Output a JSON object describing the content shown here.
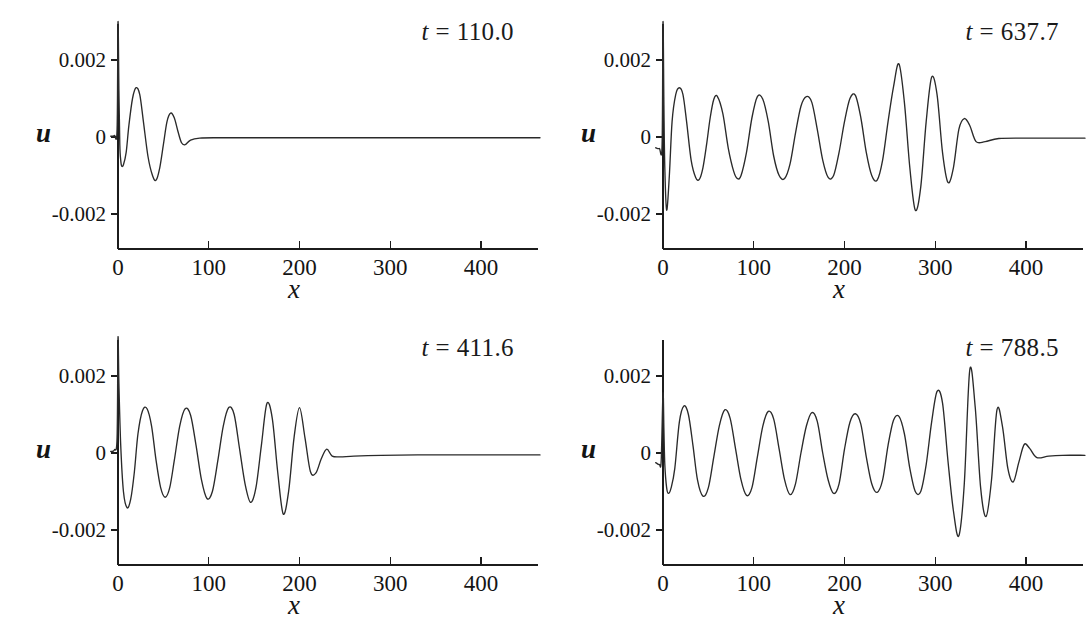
{
  "figure": {
    "background_color": "#ffffff",
    "line_color": "#2a2a2a",
    "axis_color": "#1c1c1c",
    "panel_count": 4,
    "layout": "2x2 grid"
  },
  "axes": {
    "xlabel": "x",
    "ylabel": "u",
    "x_ticks": [
      "0",
      "100",
      "200",
      "300",
      "400"
    ],
    "x_tick_values": [
      0,
      100,
      200,
      300,
      400
    ],
    "y_ticks": [
      "0.002",
      "0",
      "-0.002"
    ],
    "y_tick_values": [
      0.002,
      0,
      -0.002
    ],
    "xlim": [
      -8,
      465
    ],
    "ylim": [
      -0.0032,
      0.0032
    ],
    "grid": false
  },
  "panels": [
    {
      "id": "panel-t-110",
      "time_prefix": "t",
      "time_eq": "=",
      "time_value": "110.0",
      "label": "t = 110.0",
      "front_x": 70
    },
    {
      "id": "panel-t-637",
      "time_prefix": "t",
      "time_eq": "=",
      "time_value": "637.7",
      "label": "t = 637.7",
      "front_x": 325
    },
    {
      "id": "panel-t-411",
      "time_prefix": "t",
      "time_eq": "=",
      "time_value": "411.6",
      "label": "t = 411.6",
      "front_x": 215
    },
    {
      "id": "panel-t-788",
      "time_prefix": "t",
      "time_eq": "=",
      "time_value": "788.5",
      "label": "t = 788.5",
      "front_x": 390
    }
  ],
  "chart_data": [
    {
      "type": "line",
      "title": "t = 110.0",
      "xlabel": "x",
      "ylabel": "u",
      "xlim": [
        -8,
        465
      ],
      "ylim": [
        -0.0032,
        0.0032
      ],
      "xticks": [
        0,
        100,
        200,
        300,
        400
      ],
      "yticks": [
        -0.002,
        0,
        0.002
      ],
      "grid": false,
      "legend": "none",
      "description": "Dispersive wave train: narrow spike at x=0 clipped by upper axis limit, followed by a few decaying oscillations ending near x=70, then flat zero out to x=465.",
      "front_x": 70,
      "wavelength": 42,
      "max_amplitude": 0.0013,
      "series": [
        {
          "name": "u(x, t=110.0)",
          "points_x": [
            -8,
            -4,
            -1,
            0,
            1,
            2,
            3,
            4,
            6,
            9,
            12,
            16,
            20,
            24,
            28,
            33,
            38,
            42,
            46,
            50,
            54,
            58,
            62,
            66,
            70,
            74,
            80,
            90,
            110,
            150,
            200,
            260,
            320,
            380,
            430,
            465
          ],
          "points_y": [
            2e-05,
            4e-05,
            0.0002,
            0.0032,
            0.0012,
            -0.0002,
            -0.0006,
            -0.00075,
            -0.00072,
            -0.0004,
            0.0003,
            0.001,
            0.00128,
            0.0011,
            0.0004,
            -0.0005,
            -0.001,
            -0.00112,
            -0.0008,
            -0.0002,
            0.0004,
            0.00062,
            0.0005,
            0.00015,
            -0.00015,
            -0.0002,
            -8e-05,
            -3e-05,
            -2e-05,
            -2e-05,
            -2e-05,
            -2e-05,
            -2e-05,
            -2e-05,
            -2e-05,
            -2e-05
          ]
        }
      ]
    },
    {
      "type": "line",
      "title": "t = 637.7",
      "xlabel": "x",
      "ylabel": "u",
      "xlim": [
        -8,
        465
      ],
      "ylim": [
        -0.0032,
        0.0032
      ],
      "xticks": [
        0,
        100,
        200,
        300,
        400
      ],
      "yticks": [
        -0.002,
        0,
        0.002
      ],
      "grid": false,
      "legend": "none",
      "description": "Long dispersive wave train with ~13 oscillations of wavelength ~42; amplitude grows toward the leading front near x=260-285 reaching about +0.0019 / -0.0021, then decays rapidly to zero beyond x=330.",
      "front_x": 325,
      "wavelength": 42,
      "max_amplitude": 0.0021,
      "series": [
        {
          "name": "u(x, t=637.7)",
          "points_x": [
            -8,
            -4,
            -1,
            0,
            1,
            2,
            4,
            7,
            10,
            14,
            18,
            22,
            26,
            31,
            36,
            40,
            44,
            48,
            52,
            56,
            60,
            66,
            72,
            78,
            82,
            86,
            92,
            98,
            104,
            110,
            116,
            122,
            128,
            134,
            140,
            146,
            152,
            158,
            164,
            170,
            176,
            182,
            188,
            194,
            200,
            206,
            212,
            218,
            224,
            230,
            236,
            242,
            248,
            254,
            260,
            266,
            272,
            278,
            284,
            290,
            296,
            302,
            308,
            314,
            320,
            326,
            332,
            338,
            345,
            355,
            370,
            400,
            430,
            465
          ],
          "points_y": [
            -0.00028,
            -0.0003,
            -0.0002,
            0.0032,
            0.0008,
            -0.0008,
            -0.0019,
            -0.001,
            0.0004,
            0.0011,
            0.00128,
            0.0011,
            0.0004,
            -0.0006,
            -0.00105,
            -0.0011,
            -0.0008,
            -0.0002,
            0.0005,
            0.00098,
            0.00105,
            0.0006,
            -0.0003,
            -0.0009,
            -0.00108,
            -0.001,
            -0.0004,
            0.0005,
            0.00105,
            0.00098,
            0.0004,
            -0.0005,
            -0.001,
            -0.00108,
            -0.0007,
            0.0001,
            0.0008,
            0.00105,
            0.0009,
            0.0002,
            -0.0006,
            -0.00105,
            -0.001,
            -0.0004,
            0.0004,
            0.001,
            0.00108,
            0.0005,
            -0.0004,
            -0.001,
            -0.00112,
            -0.0006,
            0.0004,
            0.0013,
            0.0019,
            0.0009,
            -0.0008,
            -0.0019,
            -0.0013,
            0.0004,
            0.00155,
            0.0011,
            -0.0004,
            -0.00118,
            -0.0008,
            0.0002,
            0.00048,
            0.0003,
            -0.00012,
            -0.00012,
            -4e-05,
            -3e-05,
            -3e-05,
            -3e-05
          ]
        }
      ]
    },
    {
      "type": "line",
      "title": "t = 411.6",
      "xlabel": "x",
      "ylabel": "u",
      "xlim": [
        -8,
        465
      ],
      "ylim": [
        -0.0032,
        0.0032
      ],
      "xticks": [
        0,
        100,
        200,
        300,
        400
      ],
      "yticks": [
        -0.002,
        0,
        0.002
      ],
      "grid": false,
      "legend": "none",
      "description": "Dispersive wave train with ~8 oscillations; amplitude peaks near the front at x=155-180 (about +0.0013 / -0.0016) then decays to zero beyond x=230; flat thereafter.",
      "front_x": 215,
      "wavelength": 42,
      "max_amplitude": 0.0016,
      "series": [
        {
          "name": "u(x, t=411.6)",
          "points_x": [
            -8,
            -4,
            -1,
            0,
            1,
            3,
            6,
            10,
            14,
            18,
            22,
            27,
            32,
            37,
            42,
            47,
            52,
            57,
            62,
            68,
            74,
            80,
            86,
            92,
            98,
            104,
            110,
            116,
            122,
            128,
            134,
            140,
            146,
            152,
            158,
            164,
            170,
            176,
            182,
            188,
            194,
            200,
            206,
            212,
            218,
            224,
            230,
            236,
            245,
            260,
            290,
            330,
            380,
            430,
            465
          ],
          "points_y": [
            4e-05,
            8e-05,
            0.0004,
            0.0032,
            0.0018,
            0.0002,
            -0.001,
            -0.00142,
            -0.0012,
            -0.0005,
            0.0005,
            0.0011,
            0.00115,
            0.0007,
            -0.0002,
            -0.0009,
            -0.00115,
            -0.0009,
            -0.0002,
            0.0007,
            0.00115,
            0.00098,
            0.0002,
            -0.0007,
            -0.00118,
            -0.001,
            -0.0002,
            0.0007,
            0.00118,
            0.001,
            0.0001,
            -0.0008,
            -0.00128,
            -0.0009,
            0.0002,
            0.00128,
            0.0009,
            -0.0005,
            -0.00158,
            -0.001,
            0.0004,
            0.00118,
            0.0004,
            -0.00048,
            -0.00052,
            -0.00015,
            0.0001,
            -8e-05,
            -0.0001,
            -8e-05,
            -6e-05,
            -5e-05,
            -5e-05,
            -5e-05,
            -5e-05
          ]
        }
      ]
    },
    {
      "type": "line",
      "title": "t = 788.5",
      "xlabel": "x",
      "ylabel": "u",
      "xlim": [
        -8,
        465
      ],
      "ylim": [
        -0.0032,
        0.0032
      ],
      "xticks": [
        0,
        100,
        200,
        300,
        400
      ],
      "yticks": [
        -0.002,
        0,
        0.002
      ],
      "grid": false,
      "legend": "none",
      "description": "Longest dispersive wave train, ~16 oscillations of wavelength ~42; largest amplitude at the leading front near x=310-345 reaching about +0.0022 / -0.0023, then rapid decay to zero beyond x=405.",
      "front_x": 390,
      "wavelength": 42,
      "max_amplitude": 0.0023,
      "series": [
        {
          "name": "u(x, t=788.5)",
          "points_x": [
            -8,
            -4,
            -2,
            0,
            1,
            2,
            4,
            6,
            9,
            13,
            18,
            23,
            28,
            33,
            38,
            44,
            50,
            56,
            62,
            68,
            74,
            80,
            86,
            92,
            98,
            104,
            110,
            116,
            122,
            128,
            134,
            140,
            146,
            152,
            158,
            164,
            170,
            176,
            182,
            188,
            194,
            200,
            206,
            212,
            218,
            224,
            230,
            236,
            242,
            248,
            254,
            260,
            266,
            272,
            278,
            284,
            290,
            296,
            302,
            308,
            314,
            320,
            326,
            332,
            338,
            344,
            350,
            356,
            362,
            368,
            374,
            380,
            386,
            392,
            398,
            404,
            412,
            425,
            440,
            465
          ],
          "points_y": [
            -0.00025,
            -0.0003,
            -0.0002,
            0.00155,
            0.0006,
            -0.0003,
            -0.0009,
            -0.00105,
            -0.0009,
            -0.0004,
            0.0008,
            0.00122,
            0.001,
            0.0002,
            -0.0007,
            -0.00112,
            -0.0009,
            -0.0001,
            0.0007,
            0.00112,
            0.0009,
            0.0001,
            -0.0007,
            -0.0011,
            -0.0009,
            -0.0001,
            0.0007,
            0.00108,
            0.00088,
            0.0001,
            -0.0007,
            -0.00108,
            -0.0008,
            0.0,
            0.0007,
            0.00105,
            0.00082,
            0.0,
            -0.0007,
            -0.00105,
            -0.0008,
            0.0001,
            0.0008,
            0.00102,
            0.00075,
            -0.0001,
            -0.0008,
            -0.00102,
            -0.0007,
            0.0002,
            0.00085,
            0.00095,
            0.0005,
            -0.0004,
            -0.001,
            -0.001,
            -0.0003,
            0.0008,
            0.0016,
            0.0013,
            -0.0002,
            -0.0015,
            -0.00215,
            -0.0008,
            0.00215,
            0.0012,
            -0.0009,
            -0.00165,
            -0.0007,
            0.00112,
            0.0007,
            -0.0004,
            -0.00075,
            -0.00025,
            0.00022,
            0.00012,
            -0.00012,
            -8e-05,
            -6e-05,
            -6e-05
          ]
        }
      ]
    }
  ]
}
